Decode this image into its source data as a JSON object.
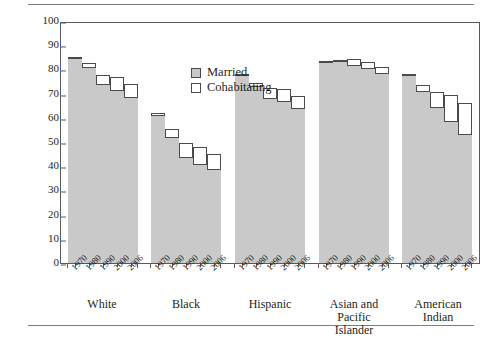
{
  "chart_data": {
    "type": "bar",
    "subtype": "stacked-grouped",
    "title": "",
    "xlabel": "",
    "ylabel": "Percentage Married or Cohabiting",
    "ylim": [
      0,
      100
    ],
    "ytick_step": 10,
    "yticks": [
      100,
      90,
      80,
      70,
      60,
      50,
      40,
      30,
      20,
      10,
      0
    ],
    "grid": false,
    "legend_position": "inside-top-center",
    "legend": [
      {
        "name": "Married",
        "swatch": "married",
        "color": "#c9c9c9"
      },
      {
        "name": "Cohabitating",
        "swatch": "cohab",
        "color": "#ffffff"
      }
    ],
    "categories": [
      "1970",
      "1980",
      "1990",
      "2000",
      "2006"
    ],
    "groups": [
      {
        "name": "White",
        "label_lines": [
          "White"
        ],
        "years": [
          "1970",
          "1980",
          "1990",
          "2000",
          "2006"
        ],
        "married": [
          85,
          81,
          74,
          71.5,
          68.5
        ],
        "total": [
          85,
          82.5,
          77.5,
          77,
          74
        ],
        "cohabiting": [
          0,
          1.5,
          3.5,
          5.5,
          5.5
        ]
      },
      {
        "name": "Black",
        "label_lines": [
          "Black"
        ],
        "years": [
          "1970",
          "1980",
          "1990",
          "2000",
          "2006"
        ],
        "married": [
          61,
          52,
          44,
          41,
          39
        ],
        "total": [
          62,
          55.5,
          49.5,
          48,
          45
        ],
        "cohabiting": [
          1,
          3.5,
          5.5,
          7,
          6
        ]
      },
      {
        "name": "Hispanic",
        "label_lines": [
          "Hispanic"
        ],
        "years": [
          "1970",
          "1980",
          "1990",
          "2000",
          "2006"
        ],
        "married": [
          78,
          73,
          68,
          67,
          64
        ],
        "total": [
          78,
          74.5,
          72.5,
          72,
          69
        ],
        "cohabiting": [
          0,
          1.5,
          4.5,
          5,
          5
        ]
      },
      {
        "name": "Asian and Pacific Islander",
        "label_lines": [
          "Asian and Pacific",
          "Islander"
        ],
        "years": [
          "1970",
          "1980",
          "1990",
          "2000",
          "2006"
        ],
        "married": [
          83.5,
          83.5,
          82,
          80.5,
          78.5
        ],
        "total": [
          83.5,
          84,
          84.5,
          83,
          81
        ],
        "cohabiting": [
          0,
          0.5,
          2.5,
          2.5,
          2.5
        ]
      },
      {
        "name": "American Indian",
        "label_lines": [
          "American",
          "Indian"
        ],
        "years": [
          "1970",
          "1980",
          "1990",
          "2000",
          "2006"
        ],
        "married": [
          78,
          71,
          64.5,
          58.5,
          53.5
        ],
        "total": [
          78,
          73.5,
          70.5,
          69.5,
          66
        ],
        "cohabiting": [
          0,
          2.5,
          6,
          11,
          12.5
        ]
      }
    ],
    "colors": {
      "married_fill": "#c9c9c9",
      "cohabiting_fill": "#ffffff",
      "bar_stroke": "#4a4a4a",
      "axis": "#5a5a5a",
      "text": "#231f20",
      "rule": "#7d7d7d"
    }
  }
}
